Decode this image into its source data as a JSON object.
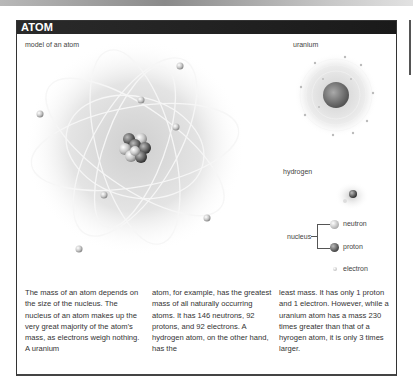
{
  "header": {
    "title": "ATOM"
  },
  "main_figure": {
    "caption": "model of an atom",
    "electron_count": 8
  },
  "uranium_figure": {
    "caption": "uranium"
  },
  "hydrogen_figure": {
    "caption": "hydrogen"
  },
  "legend": {
    "group_label": "nucleus",
    "items": [
      {
        "label": "neutron",
        "icon": "neutron-sphere-icon"
      },
      {
        "label": "proton",
        "icon": "proton-sphere-icon"
      },
      {
        "label": "electron",
        "icon": "electron-sphere-icon"
      }
    ]
  },
  "body": {
    "columns": [
      "The mass of an atom depends on the size of the nucleus. The nucleus of an atom makes up the very great majority of the atom’s mass, as electrons weigh nothing. A uranium",
      "atom, for example, has the greatest mass of all naturally occurring atoms. It has 146 neutrons, 92 protons, and 92 electrons. A hydrogen atom, on the other hand, has the",
      "least mass. It has only 1 proton and 1 electron. However, while a uranium atom has a mass 230 times greater than that of a hyrogen atom, it is only 3 times larger."
    ]
  }
}
